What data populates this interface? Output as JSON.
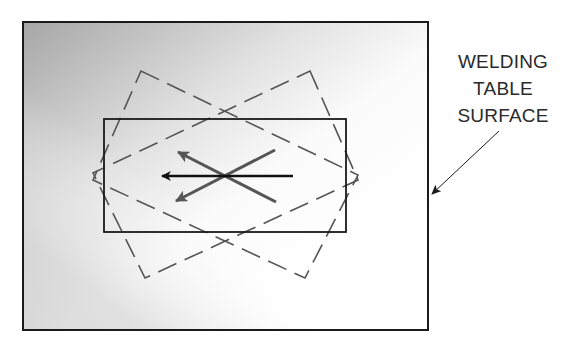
{
  "diagram": {
    "label": {
      "lines": [
        "WELDING",
        "TABLE",
        "SURFACE"
      ]
    },
    "colors": {
      "outline": "#1a1a1a",
      "dashed": "#555555",
      "arrow_primary": "#111111",
      "arrow_secondary": "#555555",
      "gradient_dark": "#a9a9a9",
      "gradient_light": "#ffffff"
    },
    "elements": {
      "table_surface": {
        "x": 23,
        "y": 22,
        "width": 405,
        "height": 308
      },
      "workpiece": {
        "x": 104,
        "y": 119,
        "width": 242,
        "height": 113
      },
      "rotated_outline_left": [
        [
          141,
          71
        ],
        [
          358,
          175
        ],
        [
          305,
          278
        ],
        [
          93,
          180
        ]
      ],
      "rotated_outline_right": [
        [
          310,
          71
        ],
        [
          358,
          180
        ],
        [
          145,
          278
        ],
        [
          93,
          173
        ]
      ],
      "arrows": {
        "center": [
          225,
          176
        ],
        "straight_left": {
          "from": [
            293,
            176
          ],
          "to": [
            160,
            176
          ]
        },
        "upper_left": {
          "from": [
            276,
            202
          ],
          "to": [
            175,
            150
          ]
        },
        "lower_left": {
          "from": [
            275,
            150
          ],
          "to": [
            173,
            203
          ]
        }
      },
      "leader_arrow": {
        "from": [
          499,
          131
        ],
        "to": [
          431,
          195
        ]
      }
    }
  }
}
